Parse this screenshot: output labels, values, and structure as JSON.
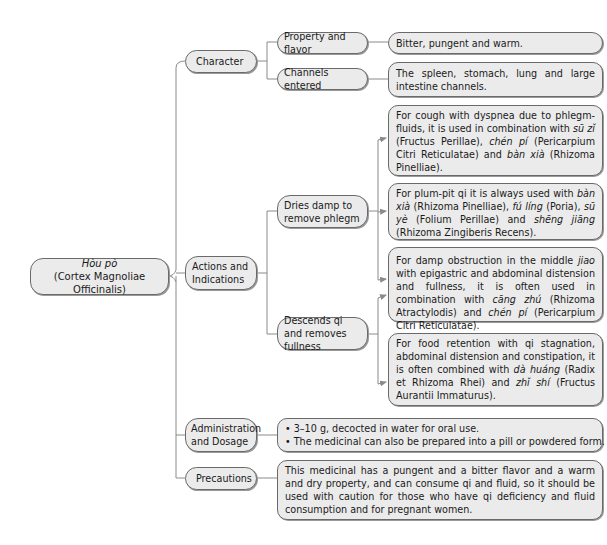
{
  "root": {
    "title": "Hòu pò",
    "subtitle": "(Cortex Magnoliae Officinalis)"
  },
  "branches": [
    {
      "label": "Character",
      "children": [
        {
          "label": "Property and flavor",
          "detail": "Bitter, pungent and warm."
        },
        {
          "label": "Channels entered",
          "detail": "The spleen, stomach, lung and large intestine channels."
        }
      ]
    },
    {
      "label": "Actions and Indications",
      "children": [
        {
          "label": "Dries damp to remove phlegm",
          "details": [
            {
              "parts": [
                {
                  "t": "For cough with dyspnea due to phlegm-fluids, it is used in combination with "
                },
                {
                  "t": "sū zǐ",
                  "i": true
                },
                {
                  "t": " (Fructus Perillae), "
                },
                {
                  "t": "chén pí",
                  "i": true
                },
                {
                  "t": " (Pericarpium Citri Reticulatae) and "
                },
                {
                  "t": "bàn xià",
                  "i": true
                },
                {
                  "t": " (Rhizoma Pinelliae)."
                }
              ]
            },
            {
              "parts": [
                {
                  "t": "For plum-pit qi it is always used with "
                },
                {
                  "t": "bàn xià",
                  "i": true
                },
                {
                  "t": " (Rhizoma Pinelliae), "
                },
                {
                  "t": "fú líng",
                  "i": true
                },
                {
                  "t": " (Poria), "
                },
                {
                  "t": "sū yè",
                  "i": true
                },
                {
                  "t": " (Folium Perillae) and "
                },
                {
                  "t": "shēng jiāng",
                  "i": true
                },
                {
                  "t": " (Rhizoma Zingiberis Recens)."
                }
              ]
            }
          ]
        },
        {
          "label": "Descends qi and removes fullness",
          "details": [
            {
              "parts": [
                {
                  "t": "For damp obstruction in the middle "
                },
                {
                  "t": "jiao",
                  "i": true
                },
                {
                  "t": " with epigastric and abdominal distension and fullness, it is often used in combination with "
                },
                {
                  "t": "cāng zhú",
                  "i": true
                },
                {
                  "t": " (Rhizoma Atractylodis) and "
                },
                {
                  "t": "chén pí",
                  "i": true
                },
                {
                  "t": " (Pericarpium Citri Reticulatae)."
                }
              ]
            },
            {
              "parts": [
                {
                  "t": "For food retention with qi stagnation, abdominal distension and constipation, it is often combined with "
                },
                {
                  "t": "dà huáng",
                  "i": true
                },
                {
                  "t": " (Radix et Rhizoma Rhei) and "
                },
                {
                  "t": "zhǐ shí",
                  "i": true
                },
                {
                  "t": " (Fructus Aurantii Immaturus)."
                }
              ]
            }
          ]
        }
      ]
    },
    {
      "label": "Administration and Dosage",
      "bullets": [
        "3–10 g, decocted in water for oral use.",
        "The medicinal can also be prepared into a pill or powdered form."
      ]
    },
    {
      "label": "Precautions",
      "detail": "This medicinal has a pungent and a bitter flavor and a warm and dry property, and can consume qi and fluid, so it should be used with caution for those who have qi deficiency and fluid consumption and for pregnant women."
    }
  ],
  "colors": {
    "box_fill": "#ebebeb",
    "box_border": "#6a6a6a",
    "line": "#8a8a8a"
  }
}
